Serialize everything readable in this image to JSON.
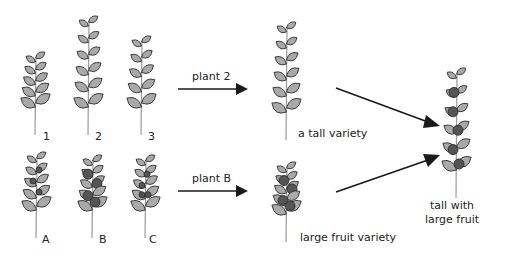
{
  "diagram": {
    "top_row_labels": [
      "1",
      "2",
      "3"
    ],
    "bottom_row_labels": [
      "A",
      "B",
      "C"
    ],
    "arrow_labels": {
      "top": "plant 2",
      "bottom": "plant B"
    },
    "result_labels": {
      "tall": "a tall variety",
      "large_fruit": "large fruit variety",
      "combined_line1": "tall with",
      "combined_line2": "large fruit"
    }
  }
}
